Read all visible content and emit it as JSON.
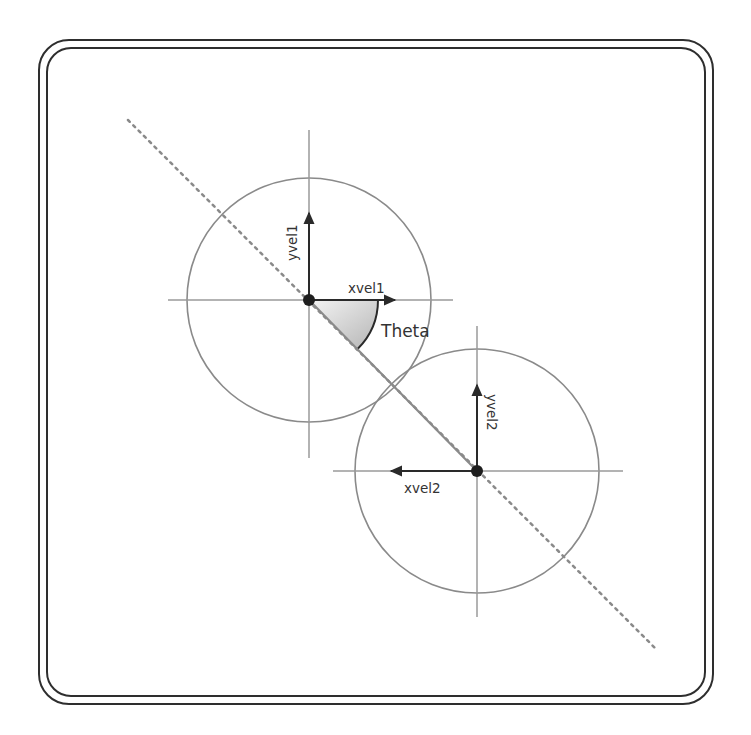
{
  "diagram": {
    "colors": {
      "background": "#ffffff",
      "frame": "#2e2e2e",
      "circle": "#8a8a8a",
      "axis": "#9a9a9a",
      "vector": "#2a2a2a",
      "center_dot": "#1e1e1e",
      "collision_line": "#8a8a8a",
      "dotted_line": "#8a8a8a",
      "wedge_light": "#f4f4f4",
      "wedge_dark": "#b5b5b5",
      "text": "#333333"
    },
    "frame": {
      "outer": {
        "x": 39,
        "y": 40,
        "w": 674,
        "h": 664,
        "r": 30
      },
      "inner": {
        "x": 47,
        "y": 48,
        "w": 658,
        "h": 648,
        "r": 24
      }
    },
    "ball1": {
      "center": [
        309,
        300
      ],
      "radius": 122,
      "h_axis": [
        168,
        453
      ],
      "v_axis": [
        130,
        458
      ],
      "labels": {
        "xvel": "xvel1",
        "yvel": "yvel1"
      },
      "xvel_arrow_end": 395,
      "yvel_arrow_end": 213
    },
    "ball2": {
      "center": [
        477,
        471
      ],
      "radius": 122,
      "h_axis": [
        333,
        623
      ],
      "v_axis": [
        326,
        617
      ],
      "labels": {
        "xvel": "xvel2",
        "yvel": "yvel2"
      },
      "xvel_arrow_end": 391,
      "yvel_arrow_end": 385
    },
    "angle": {
      "label": "Theta",
      "radius": 69,
      "degrees": 45
    },
    "dotted_line": {
      "start": [
        128,
        120
      ],
      "end": [
        655,
        648
      ]
    }
  }
}
